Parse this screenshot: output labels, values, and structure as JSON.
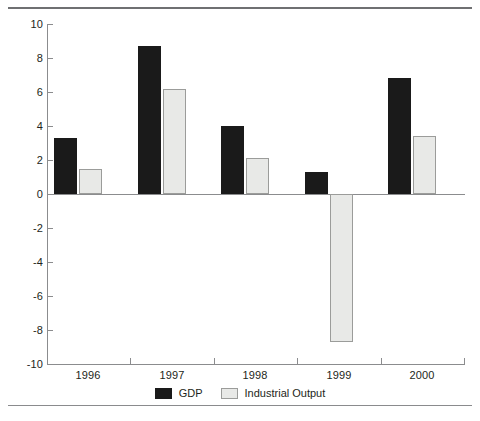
{
  "figure": {
    "name": "gdp-industrial-output-bar-chart",
    "top_rule": "horizontal-rule",
    "bottom_rule": "horizontal-rule"
  },
  "chart_data": {
    "type": "bar",
    "title": "",
    "subtitle": "",
    "xlabel": "",
    "ylabel": "",
    "categories": [
      "1996",
      "1997",
      "1998",
      "1999",
      "2000"
    ],
    "series": [
      {
        "name": "GDP",
        "color": "#1a1a1a",
        "values": [
          3.3,
          8.7,
          4.0,
          1.3,
          6.8
        ]
      },
      {
        "name": "Industrial Output",
        "color": "#e8e9e7",
        "values": [
          1.5,
          6.2,
          2.1,
          -8.7,
          3.4
        ]
      }
    ],
    "ylim": [
      -10,
      10
    ],
    "yticks": [
      10,
      8,
      6,
      4,
      2,
      0,
      -2,
      -4,
      -6,
      -8,
      -10
    ],
    "ytick_labels": [
      "10",
      "8",
      "6",
      "4",
      "2",
      "0",
      "-2",
      "-4",
      "-6",
      "-8",
      "-10"
    ],
    "grid": false,
    "zero_line": true,
    "legend_position": "bottom-center",
    "legend": [
      {
        "label": "GDP",
        "swatch": "black-filled-square"
      },
      {
        "label": "Industrial Output",
        "swatch": "light-gray-outlined-square"
      }
    ]
  }
}
